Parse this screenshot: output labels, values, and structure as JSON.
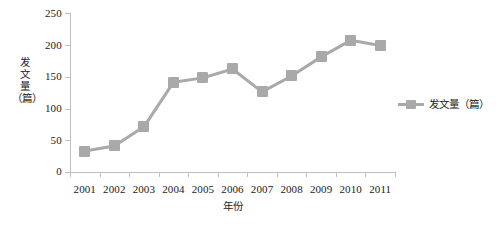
{
  "chart_data": {
    "type": "line",
    "title": "",
    "subtitle": "",
    "xlabel": "年份",
    "ylabel": "发文量（篇）",
    "ylabel_chars": [
      "发",
      "文",
      "量",
      "（篇）"
    ],
    "categories": [
      "2001",
      "2002",
      "2003",
      "2004",
      "2005",
      "2006",
      "2007",
      "2008",
      "2009",
      "2010",
      "2011"
    ],
    "series": [
      {
        "name": "发文量（篇）",
        "values": [
          33,
          41,
          71,
          141,
          148,
          162,
          126,
          151,
          181,
          207,
          199
        ]
      }
    ],
    "ylim": [
      0,
      250
    ],
    "yticks": [
      0,
      50,
      100,
      150,
      200,
      250
    ],
    "ytick_labels": [
      "0",
      "50",
      "100",
      "150",
      "200",
      "250"
    ],
    "grid": false,
    "legend": {
      "position": "right",
      "entries": [
        "发文量（篇）"
      ]
    },
    "colors": {
      "series": "#a9a9a9",
      "axis": "#bfbfbf",
      "text": "#1a1a1a",
      "background": "#ffffff"
    },
    "marker": "square"
  }
}
